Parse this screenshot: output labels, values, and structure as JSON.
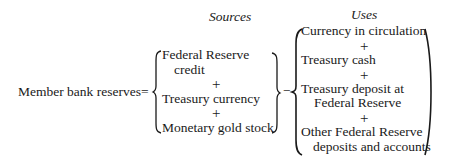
{
  "headers": {
    "sources": "Sources",
    "uses": "Uses"
  },
  "equation": {
    "lhs": "Member bank reserves",
    "equals": "=",
    "minus": "−",
    "plus": "+"
  },
  "sources": {
    "items": [
      {
        "line1": "Federal Reserve",
        "line2": "credit"
      },
      {
        "line1": "Treasury currency"
      },
      {
        "line1": "Monetary gold stock"
      }
    ]
  },
  "uses": {
    "items": [
      {
        "line1": "Currency in circulation"
      },
      {
        "line1": "Treasury cash"
      },
      {
        "line1": "Treasury deposit at",
        "line2": "Federal Reserve"
      },
      {
        "line1": "Other Federal Reserve",
        "line2": "deposits and accounts"
      }
    ]
  }
}
